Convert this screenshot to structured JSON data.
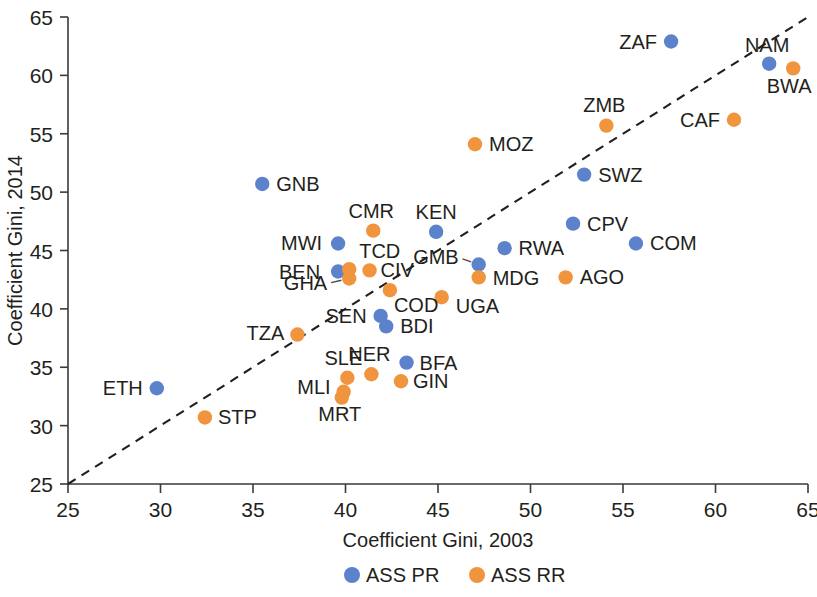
{
  "chart_data": {
    "type": "scatter",
    "title": "",
    "xlabel": "Coefficient Gini, 2003",
    "ylabel": "Coefficient Gini, 2014",
    "xlim": [
      25,
      65
    ],
    "ylim": [
      25,
      65
    ],
    "xticks": [
      25,
      30,
      35,
      40,
      45,
      50,
      55,
      60,
      65
    ],
    "yticks": [
      25,
      30,
      35,
      40,
      45,
      50,
      55,
      60,
      65
    ],
    "grid": false,
    "legend_position": "bottom",
    "reference_line": {
      "type": "identity",
      "style": "dashed",
      "from": [
        25,
        25
      ],
      "to": [
        65,
        65
      ]
    },
    "series": [
      {
        "name": "ASS PR",
        "color": "#5b82cb",
        "points": [
          {
            "label": "GNB",
            "x": 35.5,
            "y": 50.7,
            "label_dx": 14,
            "label_dy": 7,
            "anchor": "start"
          },
          {
            "label": "ZAF",
            "x": 57.6,
            "y": 62.9,
            "label_dx": -14,
            "label_dy": 7,
            "anchor": "end"
          },
          {
            "label": "NAM",
            "x": 62.9,
            "y": 61.0,
            "label_dx": -2,
            "label_dy": -12,
            "anchor": "middle"
          },
          {
            "label": "SWZ",
            "x": 52.9,
            "y": 51.5,
            "label_dx": 14,
            "label_dy": 7,
            "anchor": "start"
          },
          {
            "label": "CPV",
            "x": 52.3,
            "y": 47.3,
            "label_dx": 14,
            "label_dy": 7,
            "anchor": "start"
          },
          {
            "label": "COM",
            "x": 55.7,
            "y": 45.6,
            "label_dx": 14,
            "label_dy": 7,
            "anchor": "start"
          },
          {
            "label": "RWA",
            "x": 48.6,
            "y": 45.2,
            "label_dx": 14,
            "label_dy": 7,
            "anchor": "start"
          },
          {
            "label": "KEN",
            "x": 44.9,
            "y": 46.6,
            "label_dx": 0,
            "label_dy": -13,
            "anchor": "middle"
          },
          {
            "label": "MWI",
            "x": 39.6,
            "y": 45.6,
            "label_dx": -16,
            "label_dy": 7,
            "anchor": "end"
          },
          {
            "label": "BEN",
            "x": 39.6,
            "y": 43.2,
            "label_dx": -18,
            "label_dy": 7,
            "anchor": "end"
          },
          {
            "label": "GMB",
            "x": 47.2,
            "y": 43.8,
            "label_dx": -20,
            "label_dy": -1,
            "anchor": "end"
          },
          {
            "label": "SEN",
            "x": 41.9,
            "y": 39.4,
            "label_dx": -14,
            "label_dy": 7,
            "anchor": "end"
          },
          {
            "label": "BDI",
            "x": 42.2,
            "y": 38.5,
            "label_dx": 14,
            "label_dy": 7,
            "anchor": "start"
          },
          {
            "label": "BFA",
            "x": 43.3,
            "y": 35.4,
            "label_dx": 13,
            "label_dy": 7,
            "anchor": "start"
          },
          {
            "label": "ETH",
            "x": 29.8,
            "y": 33.2,
            "label_dx": -14,
            "label_dy": 7,
            "anchor": "end"
          }
        ]
      },
      {
        "name": "ASS RR",
        "color": "#f0943e",
        "points": [
          {
            "label": "BWA",
            "x": 64.2,
            "y": 60.6,
            "label_dx": -4,
            "label_dy": 25,
            "anchor": "middle"
          },
          {
            "label": "ZMB",
            "x": 54.1,
            "y": 55.7,
            "label_dx": -2,
            "label_dy": -14,
            "anchor": "middle"
          },
          {
            "label": "CAF",
            "x": 61.0,
            "y": 56.2,
            "label_dx": -14,
            "label_dy": 7,
            "anchor": "end"
          },
          {
            "label": "MOZ",
            "x": 47.0,
            "y": 54.1,
            "label_dx": 14,
            "label_dy": 7,
            "anchor": "start"
          },
          {
            "label": "CMR",
            "x": 41.5,
            "y": 46.7,
            "label_dx": -2,
            "label_dy": -13,
            "anchor": "middle"
          },
          {
            "label": "AGO",
            "x": 51.9,
            "y": 42.7,
            "label_dx": 14,
            "label_dy": 7,
            "anchor": "start"
          },
          {
            "label": "MDG",
            "x": 47.2,
            "y": 42.7,
            "label_dx": 14,
            "label_dy": 8,
            "anchor": "start"
          },
          {
            "label": "TCD",
            "x": 40.2,
            "y": 43.4,
            "label_dx": 10,
            "label_dy": -11,
            "anchor": "start"
          },
          {
            "label": "CIV",
            "x": 41.3,
            "y": 43.3,
            "label_dx": 11,
            "label_dy": 7,
            "anchor": "start"
          },
          {
            "label": "GHA",
            "x": 40.2,
            "y": 42.6,
            "label_dx": -22,
            "label_dy": 11,
            "anchor": "end"
          },
          {
            "label": "COD",
            "x": 42.4,
            "y": 41.6,
            "label_dx": 4,
            "label_dy": 22,
            "anchor": "start"
          },
          {
            "label": "UGA",
            "x": 45.2,
            "y": 41.0,
            "label_dx": 14,
            "label_dy": 16,
            "anchor": "start"
          },
          {
            "label": "TZA",
            "x": 37.4,
            "y": 37.8,
            "label_dx": -13,
            "label_dy": 5,
            "anchor": "end"
          },
          {
            "label": "NER",
            "x": 41.4,
            "y": 34.4,
            "label_dx": -2,
            "label_dy": -13,
            "anchor": "middle"
          },
          {
            "label": "SLE",
            "x": 40.1,
            "y": 34.1,
            "label_dx": -4,
            "label_dy": -13,
            "anchor": "middle"
          },
          {
            "label": "GIN",
            "x": 43.0,
            "y": 33.8,
            "label_dx": 12,
            "label_dy": 7,
            "anchor": "start"
          },
          {
            "label": "MLI",
            "x": 39.9,
            "y": 32.9,
            "label_dx": -13,
            "label_dy": 2,
            "anchor": "end"
          },
          {
            "label": "MRT",
            "x": 39.8,
            "y": 32.4,
            "label_dx": -2,
            "label_dy": 23,
            "anchor": "middle"
          },
          {
            "label": "STP",
            "x": 32.4,
            "y": 30.7,
            "label_dx": 13,
            "label_dy": 7,
            "anchor": "start"
          }
        ]
      }
    ]
  },
  "legend": {
    "items": [
      {
        "label": "ASS PR",
        "color": "#5b82cb"
      },
      {
        "label": "ASS RR",
        "color": "#f0943e"
      }
    ]
  }
}
